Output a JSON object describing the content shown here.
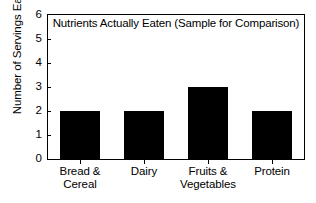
{
  "chart_data": {
    "type": "bar",
    "title": "Nutrients Actually Eaten (Sample for Comparison)",
    "xlabel": "",
    "ylabel": "Number of Servings Eaten",
    "categories": [
      "Bread & Cereal",
      "Dairy",
      "Fruits & Vegetables",
      "Protein"
    ],
    "category_lines": [
      [
        "Bread &",
        "Cereal"
      ],
      [
        "Dairy",
        ""
      ],
      [
        "Fruits &",
        "Vegetables"
      ],
      [
        "Protein",
        ""
      ]
    ],
    "values": [
      2,
      2,
      3,
      2
    ],
    "ylim": [
      0,
      6
    ],
    "yticks": [
      0,
      1,
      2,
      3,
      4,
      5,
      6
    ],
    "ytick_labels": [
      "0",
      "1",
      "2",
      "3",
      "4",
      "5",
      "6"
    ],
    "grid": false,
    "legend": false,
    "bar_color": "#000000",
    "axis_color": "#000000",
    "background_color": "#ffffff"
  }
}
